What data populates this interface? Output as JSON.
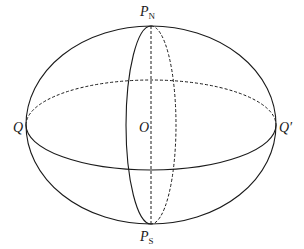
{
  "diagram": {
    "type": "ellipsoid-with-equator-and-meridian",
    "colors": {
      "stroke": "#1a1a1a",
      "background": "#ffffff"
    },
    "center": {
      "x": 151,
      "y": 125
    },
    "outer_ellipse": {
      "rx": 125,
      "ry": 99
    },
    "equator": {
      "rx": 125,
      "ry": 45,
      "front": "solid",
      "back": "dashed"
    },
    "meridian": {
      "rx": 25,
      "ry": 99,
      "front": "solid",
      "back": "dashed"
    },
    "axis": {
      "style": "dashed"
    },
    "labels": {
      "north_pole": {
        "main": "P",
        "sub": "N"
      },
      "south_pole": {
        "main": "P",
        "sub": "S"
      },
      "left_point": "Q",
      "right_point": "Q′",
      "origin": "O"
    }
  }
}
